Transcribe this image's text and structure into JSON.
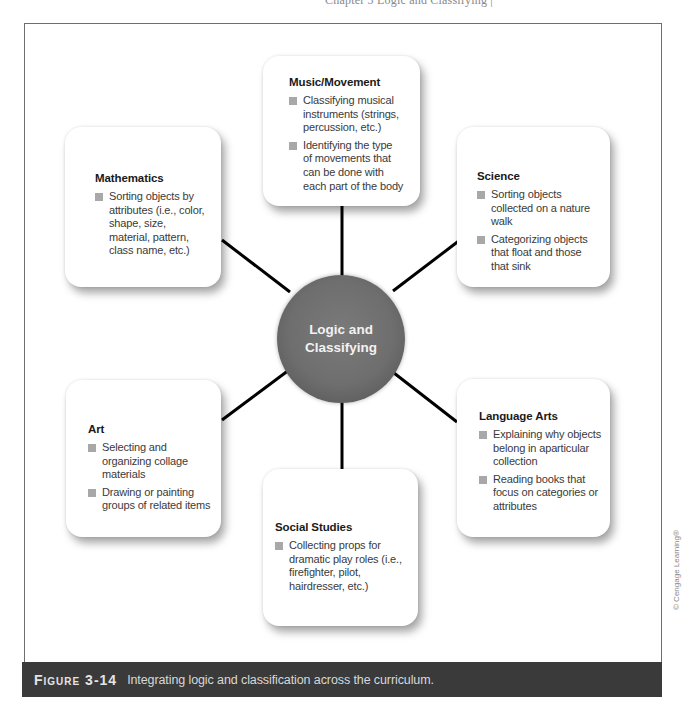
{
  "page": {
    "clipped_header_text": "Chapter 3  Logic and Classifying  |"
  },
  "diagram": {
    "hub": {
      "label": "Logic and Classifying",
      "color": "#6e6e6e"
    },
    "connector_color": "#000000",
    "bullet_color": "#a8a8a8",
    "nodes": [
      {
        "id": "music-movement",
        "title": "Music/Movement",
        "items": [
          "Classifying musical instruments (strings, percussion, etc.)",
          "Identifying the type of movements that can be done with each part of the body"
        ]
      },
      {
        "id": "mathematics",
        "title": "Mathematics",
        "items": [
          "Sorting objects by attributes (i.e., color, shape, size, material, pattern, class name, etc.)"
        ]
      },
      {
        "id": "science",
        "title": "Science",
        "items": [
          "Sorting objects collected on a nature walk",
          "Categorizing objects that float and those that sink"
        ]
      },
      {
        "id": "art",
        "title": "Art",
        "items": [
          "Selecting and organizing collage materials",
          "Drawing or painting groups of related items"
        ]
      },
      {
        "id": "language-arts",
        "title": "Language Arts",
        "items": [
          "Explaining why objects belong in aparticular collection",
          "Reading books that focus on categories or attributes"
        ]
      },
      {
        "id": "social-studies",
        "title": "Social Studies",
        "items": [
          "Collecting props for dramatic play roles (i.e., firefighter, pilot, hairdresser, etc.)"
        ]
      }
    ]
  },
  "caption": {
    "label": "Figure 3-14",
    "text": "Integrating logic and classification across the curriculum.",
    "background": "#3a3a3a"
  },
  "credit": "© Cengage Learning®"
}
